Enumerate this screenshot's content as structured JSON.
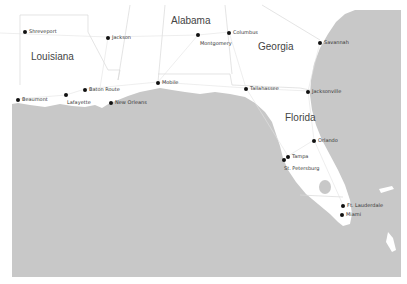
{
  "map": {
    "colors": {
      "land": "#ffffff",
      "water": "#c8c8c8",
      "border": "#d4d4d4",
      "road": "#dcdcdc",
      "text": "#333333",
      "dot": "#111111"
    },
    "states": [
      {
        "name": "Louisiana",
        "x": 31,
        "y": 51
      },
      {
        "name": "Alabama",
        "x": 171,
        "y": 15
      },
      {
        "name": "Georgia",
        "x": 258,
        "y": 41
      },
      {
        "name": "Florida",
        "x": 285,
        "y": 112
      }
    ],
    "cities": [
      {
        "name": "Shreveport",
        "x": 25,
        "y": 31
      },
      {
        "name": "Jackson",
        "x": 108,
        "y": 37
      },
      {
        "name": "Montgomery",
        "x": 198,
        "y": 35,
        "label_below": true
      },
      {
        "name": "Columbus",
        "x": 229,
        "y": 32
      },
      {
        "name": "Savannah",
        "x": 320,
        "y": 42
      },
      {
        "name": "Baton Route",
        "x": 85,
        "y": 89
      },
      {
        "name": "Lafayette",
        "x": 66,
        "y": 95,
        "label_below": true
      },
      {
        "name": "Beaumont",
        "x": 18,
        "y": 99
      },
      {
        "name": "New Orleans",
        "x": 111,
        "y": 102
      },
      {
        "name": "Mobile",
        "x": 158,
        "y": 82
      },
      {
        "name": "Tallahassee",
        "x": 246,
        "y": 88
      },
      {
        "name": "Jacksonville",
        "x": 308,
        "y": 91
      },
      {
        "name": "Orlando",
        "x": 314,
        "y": 140
      },
      {
        "name": "Tampa",
        "x": 288,
        "y": 156
      },
      {
        "name": "St. Petersburg",
        "x": 284,
        "y": 160,
        "label_below": true
      },
      {
        "name": "Ft. Lauderdale",
        "x": 343,
        "y": 205
      },
      {
        "name": "Miami",
        "x": 342,
        "y": 214
      }
    ]
  }
}
